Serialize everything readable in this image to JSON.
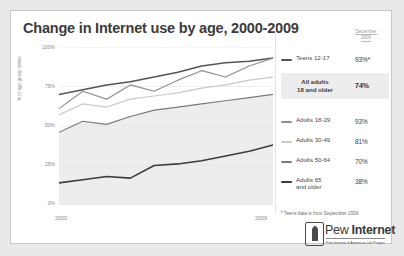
{
  "chart_data": {
    "type": "line",
    "title": "Change in Internet use by age, 2000-2009",
    "xlabel": "",
    "ylabel": "% of age group online",
    "xlim": [
      2000,
      2009
    ],
    "ylim": [
      0,
      100
    ],
    "ytick_labels": [
      "100%",
      "75%",
      "50%",
      "25%",
      "0%"
    ],
    "ytick_values": [
      100,
      75,
      50,
      25,
      0
    ],
    "xtick_labels": [
      "2000",
      "2009"
    ],
    "xtick_values": [
      2000,
      2009
    ],
    "grid": true,
    "legend_position": "right",
    "x": [
      2000,
      2001,
      2002,
      2003,
      2004,
      2005,
      2006,
      2007,
      2008,
      2009
    ],
    "series": [
      {
        "name": "Teens 12-17",
        "color": "#545454",
        "width": 1.5,
        "values": [
          70,
          73,
          76,
          78,
          81,
          84,
          88,
          90,
          91,
          93
        ]
      },
      {
        "name": "Adults 18-29",
        "color": "#8f8f8f",
        "width": 1.2,
        "values": [
          61,
          72,
          67,
          76,
          72,
          79,
          85,
          81,
          88,
          93
        ]
      },
      {
        "name": "Adults 30-49",
        "color": "#c9c9c9",
        "width": 1.2,
        "values": [
          57,
          64,
          62,
          67,
          69,
          71,
          74,
          76,
          79,
          81
        ]
      },
      {
        "name": "Adults 50-64",
        "color": "#7a7a7a",
        "width": 1.2,
        "values": [
          46,
          53,
          51,
          56,
          60,
          62,
          64,
          66,
          68,
          70
        ]
      },
      {
        "name": "Adults 65 and older",
        "color": "#3c3c3c",
        "width": 1.6,
        "values": [
          14,
          16,
          18,
          17,
          25,
          26,
          28,
          31,
          34,
          38
        ]
      }
    ],
    "band": {
      "name": "all-adults-band",
      "color": "#ededed"
    }
  },
  "header": {
    "title": "Change in Internet use by age, 2000-2009"
  },
  "axes": {
    "ylabel": "% of age group online",
    "yticks": [
      "100%",
      "75%",
      "50%",
      "25%",
      "0%"
    ],
    "xticks": [
      "2000",
      "2009"
    ]
  },
  "legend": {
    "date_header_line1": "December",
    "date_header_line2": "2009",
    "teens": {
      "label": "Teens 12-17",
      "value": "93%*",
      "color": "#545454"
    },
    "all_adults": {
      "label_line1": "All adults",
      "label_line2": "18 and older",
      "value": "74%"
    },
    "rows": [
      {
        "label": "Adults 18-29",
        "value": "93%",
        "color": "#8f8f8f",
        "thickness": "1.6px"
      },
      {
        "label": "Adults 30-49",
        "value": "81%",
        "color": "#cacaca",
        "thickness": "1.6px"
      },
      {
        "label": "Adults 50-64",
        "value": "70%",
        "color": "#7a7a7a",
        "thickness": "1.8px"
      },
      {
        "label": "Adults 65 and older",
        "value": "38%",
        "color": "#3c3c3c",
        "thickness": "2.4px"
      }
    ]
  },
  "footnote": "* Teens data is from September 2009",
  "logo": {
    "name_light": "Pew ",
    "name_bold": "Internet",
    "tagline": "Pew Internet & American Life Project"
  }
}
